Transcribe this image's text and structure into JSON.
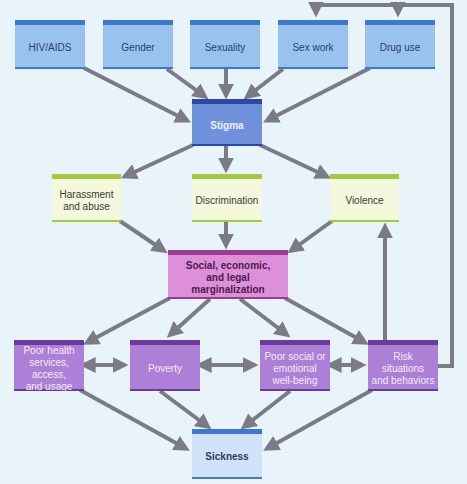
{
  "diagram": {
    "title": "",
    "colors": {
      "background": "#e9f3fa",
      "arrow": "#7b7b85",
      "factor_box": "#99c3ee",
      "stigma_box": "#6f90da",
      "response_box": "#f4f8dc",
      "marginalization_box": "#dd8fd9",
      "consequence_box": "#ad7fd6",
      "sickness_box": "#cfe2f7"
    },
    "nodes": {
      "hiv": {
        "label": "HIV/AIDS"
      },
      "gender": {
        "label": "Gender"
      },
      "sexuality": {
        "label": "Sexuality"
      },
      "sexwork": {
        "label": "Sex work"
      },
      "druguse": {
        "label": "Drug use"
      },
      "stigma": {
        "label": "Stigma"
      },
      "harassment": {
        "line1": "Harassment",
        "line2": "and abuse"
      },
      "discrimination": {
        "label": "Discrimination"
      },
      "violence": {
        "label": "Violence"
      },
      "marginalization": {
        "line1": "Social, economic,",
        "line2": "and legal marginalization"
      },
      "poorhealth": {
        "line1": "Poor health",
        "line2": "services, access,",
        "line3": "and usage"
      },
      "poverty": {
        "label": "Poverty"
      },
      "poorsocial": {
        "line1": "Poor social or",
        "line2": "emotional",
        "line3": "well-being"
      },
      "risk": {
        "line1": "Risk situations",
        "line2": "and behaviors"
      },
      "sickness": {
        "label": "Sickness"
      }
    },
    "edges": [
      {
        "from": "HIV/AIDS",
        "to": "Stigma"
      },
      {
        "from": "Gender",
        "to": "Stigma"
      },
      {
        "from": "Sexuality",
        "to": "Stigma"
      },
      {
        "from": "Sex work",
        "to": "Stigma"
      },
      {
        "from": "Drug use",
        "to": "Stigma"
      },
      {
        "from": "Stigma",
        "to": "Harassment and abuse"
      },
      {
        "from": "Stigma",
        "to": "Discrimination"
      },
      {
        "from": "Stigma",
        "to": "Violence"
      },
      {
        "from": "Harassment and abuse",
        "to": "Social, economic, and legal marginalization"
      },
      {
        "from": "Discrimination",
        "to": "Social, economic, and legal marginalization"
      },
      {
        "from": "Violence",
        "to": "Social, economic, and legal marginalization"
      },
      {
        "from": "Social, economic, and legal marginalization",
        "to": "Poor health services, access, and usage"
      },
      {
        "from": "Social, economic, and legal marginalization",
        "to": "Poverty"
      },
      {
        "from": "Social, economic, and legal marginalization",
        "to": "Poor social or emotional well-being"
      },
      {
        "from": "Social, economic, and legal marginalization",
        "to": "Risk situations and behaviors"
      },
      {
        "from": "Poor health services, access, and usage",
        "to": "Poverty",
        "bidirectional": true
      },
      {
        "from": "Poverty",
        "to": "Poor social or emotional well-being",
        "bidirectional": true
      },
      {
        "from": "Poor social or emotional well-being",
        "to": "Risk situations and behaviors",
        "bidirectional": true
      },
      {
        "from": "Risk situations and behaviors",
        "to": "Violence"
      },
      {
        "from": "Risk situations and behaviors",
        "to": "Sex work"
      },
      {
        "from": "Risk situations and behaviors",
        "to": "Drug use"
      },
      {
        "from": "Poor health services, access, and usage",
        "to": "Sickness"
      },
      {
        "from": "Poverty",
        "to": "Sickness"
      },
      {
        "from": "Poor social or emotional well-being",
        "to": "Sickness"
      },
      {
        "from": "Risk situations and behaviors",
        "to": "Sickness"
      }
    ]
  }
}
